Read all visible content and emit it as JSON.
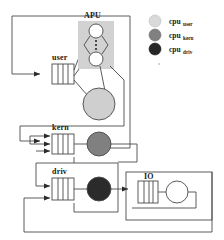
{
  "figure": {
    "type": "queueing-network-diagram",
    "background": "#ffffff",
    "line_color": "#3a3a3a"
  },
  "stations": {
    "user": {
      "label": "user",
      "queue_slots": 3,
      "server_color": "#cfcfcf"
    },
    "kern": {
      "label": "kern",
      "queue_slots": 3,
      "server_color": "#808080",
      "input_arrows": 3
    },
    "driv": {
      "label": "driv",
      "queue_slots": 3,
      "server_color": "#2b2b2b",
      "input_arrows": 2
    },
    "io": {
      "label": "IO",
      "queue_slots": 3,
      "server_color": "#ffffff"
    }
  },
  "apu": {
    "label": "APU",
    "box_color": "#d2d2d2",
    "node_color": "#ffffff",
    "ellipsis_dots": 3
  },
  "legend": {
    "items": [
      {
        "base": "cpu",
        "sub": "user",
        "color": "#d9d9d9"
      },
      {
        "base": "cpu",
        "sub": "kern",
        "color": "#808080"
      },
      {
        "base": "cpu",
        "sub": "driv",
        "color": "#262626"
      }
    ]
  }
}
